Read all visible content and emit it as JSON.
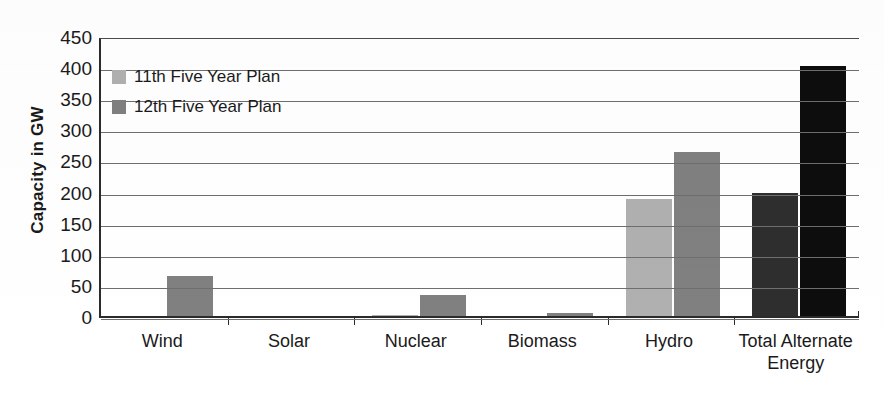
{
  "chart_data": {
    "type": "bar",
    "title": "",
    "xlabel": "",
    "ylabel": "Capacity in GW",
    "ylim": [
      0,
      450
    ],
    "ytick_step": 50,
    "yticks": [
      450,
      400,
      350,
      300,
      250,
      200,
      150,
      100,
      50,
      0
    ],
    "grid": true,
    "legend_position": "top-left inside plot",
    "categories": [
      "Wind",
      "Solar",
      "Nuclear",
      "Biomass",
      "Hydro",
      "Total Alternate\nEnergy"
    ],
    "series": [
      {
        "name": "11th Five Year Plan",
        "color": "#b0b0b0",
        "values": [
          2,
          0.5,
          5,
          2,
          192,
          201
        ]
      },
      {
        "name": "12th Five Year Plan",
        "color": "#808080",
        "values": [
          68,
          4,
          37,
          8,
          267,
          405
        ]
      }
    ],
    "bar_color_overrides": {
      "Total Alternate\nEnergy": {
        "11th Five Year Plan": "#2e2e2e",
        "12th Five Year Plan": "#0d0d0d"
      }
    }
  },
  "legend": {
    "items": [
      {
        "label": "11th Five Year Plan",
        "swatch_color": "#b0b0b0"
      },
      {
        "label": "12th Five Year Plan",
        "swatch_color": "#808080"
      }
    ]
  },
  "axis": {
    "y_title": "Capacity in GW"
  }
}
